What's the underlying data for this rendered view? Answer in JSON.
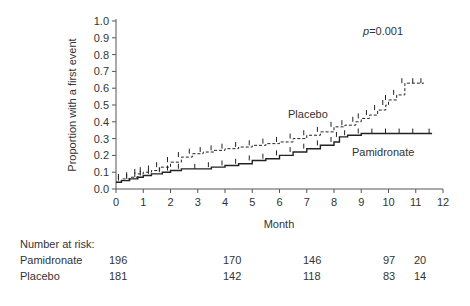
{
  "chart_data": {
    "type": "line",
    "subtype": "kaplan-meier cumulative incidence (step)",
    "title": "",
    "annotation": "p=0.001",
    "xlabel": "Month",
    "ylabel": "Proportion with a first event",
    "xlim": [
      0,
      12
    ],
    "ylim": [
      0.0,
      1.0
    ],
    "x_ticks": [
      "0",
      "1",
      "2",
      "3",
      "4",
      "5",
      "6",
      "7",
      "8",
      "9",
      "10",
      "11",
      "12"
    ],
    "y_ticks": [
      "0.0",
      "0.1",
      "0.2",
      "0.3",
      "0.4",
      "0.5",
      "0.6",
      "0.7",
      "0.8",
      "0.9",
      "1.0"
    ],
    "grid": false,
    "legend": "inline labels",
    "series": [
      {
        "name": "Placebo",
        "style": "dashed",
        "x": [
          0,
          0.2,
          0.5,
          0.8,
          1.0,
          1.3,
          1.6,
          2.0,
          2.4,
          2.8,
          3.2,
          3.6,
          4.0,
          4.5,
          5.0,
          5.5,
          6.0,
          6.5,
          7.0,
          7.5,
          8.0,
          8.4,
          8.8,
          9.0,
          9.3,
          9.6,
          9.9,
          10.0,
          10.3,
          10.6,
          11.0,
          11.3
        ],
        "values": [
          0.04,
          0.06,
          0.07,
          0.09,
          0.1,
          0.11,
          0.13,
          0.16,
          0.19,
          0.21,
          0.22,
          0.23,
          0.24,
          0.25,
          0.26,
          0.27,
          0.28,
          0.3,
          0.32,
          0.34,
          0.37,
          0.38,
          0.4,
          0.42,
          0.44,
          0.47,
          0.5,
          0.53,
          0.56,
          0.63,
          0.63,
          0.63
        ]
      },
      {
        "name": "Pamidronate",
        "style": "solid",
        "x": [
          0,
          0.2,
          0.5,
          0.8,
          1.0,
          1.3,
          1.7,
          2.0,
          2.4,
          3.0,
          3.5,
          4.0,
          4.5,
          5.0,
          5.5,
          6.0,
          6.5,
          7.0,
          7.5,
          8.0,
          8.2,
          8.5,
          9.0,
          9.5,
          10.0,
          10.5,
          11.0,
          11.6
        ],
        "values": [
          0.04,
          0.05,
          0.06,
          0.07,
          0.08,
          0.09,
          0.1,
          0.11,
          0.12,
          0.12,
          0.13,
          0.14,
          0.15,
          0.17,
          0.18,
          0.2,
          0.22,
          0.24,
          0.26,
          0.28,
          0.31,
          0.32,
          0.33,
          0.33,
          0.33,
          0.33,
          0.33,
          0.33
        ]
      }
    ],
    "number_at_risk": {
      "label": "Number at risk:",
      "months": [
        0,
        3,
        6,
        9,
        10
      ],
      "rows": [
        {
          "name": "Pamidronate",
          "values": [
            196,
            170,
            146,
            97,
            20
          ]
        },
        {
          "name": "Placebo",
          "values": [
            181,
            142,
            118,
            83,
            14
          ]
        }
      ]
    }
  },
  "labels": {
    "p_value_prefix": "p",
    "p_value_suffix": "=0.001",
    "placebo": "Placebo",
    "pamidronate": "Pamidronate",
    "xlabel": "Month",
    "ylabel": "Proportion with a first event",
    "risk_header": "Number at risk:"
  }
}
